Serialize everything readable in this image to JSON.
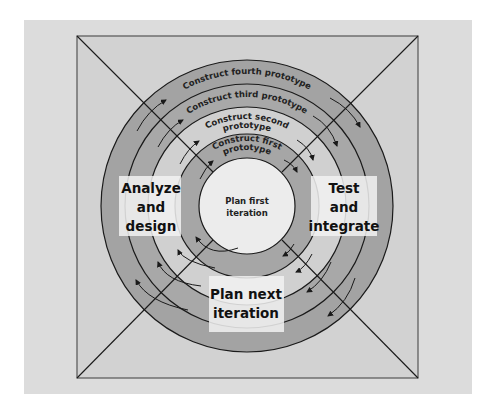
{
  "diagram": {
    "type": "spiral-iterative-model",
    "colors": {
      "page_bg": "#ffffff",
      "panel_bg": "#dcdcdc",
      "square_bg": "#d2d2d2",
      "inner_circle": "#ececec",
      "ring_dark": "#a3a3a3",
      "ring_light": "#d0d0d0",
      "ring_mid": "#bcbcbc",
      "line": "#1a1a1a",
      "label_box": "#f2f2f2"
    },
    "center": {
      "line1": "Plan first",
      "line2": "iteration"
    },
    "rings": [
      {
        "label_line1": "Construct first",
        "label_line2": "prototype"
      },
      {
        "label_line1": "Construct second",
        "label_line2": "prototype"
      },
      {
        "label_line1": "Construct third prototype"
      },
      {
        "label_line1": "Construct fourth prototype"
      }
    ],
    "phases": {
      "left": {
        "line1": "Analyze",
        "line2": "and",
        "line3": "design"
      },
      "right": {
        "line1": "Test",
        "line2": "and",
        "line3": "integrate"
      },
      "bottom": {
        "line1": "Plan next",
        "line2": "iteration"
      }
    }
  }
}
